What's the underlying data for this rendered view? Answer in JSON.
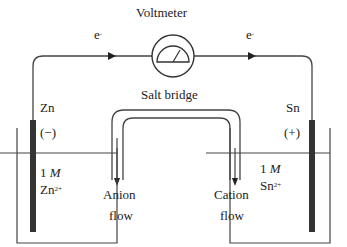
{
  "diagram": {
    "voltmeter_label": "Voltmeter",
    "electron_left": "e",
    "electron_right": "e",
    "electron_charge": "-",
    "salt_bridge_label": "Salt bridge",
    "anode": {
      "metal": "Zn",
      "sign": "(−)",
      "concentration": "1",
      "unit": "M",
      "ion": "Zn",
      "ion_charge": "2+"
    },
    "cathode": {
      "metal": "Sn",
      "sign": "(+)",
      "concentration": "1",
      "unit": "M",
      "ion": "Sn",
      "ion_charge": "2+"
    },
    "anion_flow": {
      "line1": "Anion",
      "line2": "flow"
    },
    "cation_flow": {
      "line1": "Cation",
      "line2": "flow"
    },
    "colors": {
      "line": "#333333",
      "electrode": "#333333",
      "background": "#ffffff"
    }
  }
}
